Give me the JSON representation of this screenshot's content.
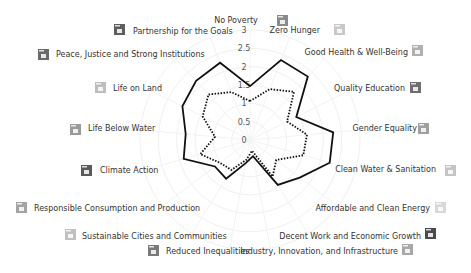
{
  "chart_data": {
    "type": "radar",
    "title": "",
    "center": [
      250,
      140
    ],
    "radius_px": 110,
    "rmax": 3,
    "ticks": [
      "0",
      "0.5",
      "1",
      "1.5",
      "2",
      "2.5",
      "3"
    ],
    "grid": true,
    "categories": [
      "No Poverty",
      "Zero Hunger",
      "Good Health & Well-Being",
      "Quality Education",
      "Gender Equality",
      "Clean Water & Sanitation",
      "Affordable and Clean Energy",
      "Decent Work and Economic Growth",
      "Industry, Innovation, and Infrastructure",
      "Reduced Inequalities",
      "Sustainable Cities and Communities",
      "Responsible Consumption and Production",
      "Climate Action",
      "Life Below Water",
      "Life on Land",
      "Peace, Justice and Strong Institutions",
      "Partnership for the Goals"
    ],
    "icon_colors": [
      "#8a8a8a",
      "#c8c8c8",
      "#b0b0b0",
      "#6e6e6e",
      "#a0a0a0",
      "#c4c4c4",
      "#d8d8d8",
      "#4a4a4a",
      "#a8a8a8",
      "#7a7a7a",
      "#c0c0c0",
      "#a4a4a4",
      "#5a5a5a",
      "#9a9a9a",
      "#bdbdbd",
      "#6a6a6a",
      "#5e5e5e"
    ],
    "series": [
      {
        "name": "Series 1",
        "style": "solid",
        "values": [
          1.47,
          2.34,
          2.34,
          1.41,
          2.28,
          2.26,
          1.7,
          1.44,
          0.45,
          0.64,
          1.24,
          1.2,
          1.88,
          1.76,
          2.06,
          2.18,
          2.26
        ]
      },
      {
        "name": "Series 2",
        "style": "dotted",
        "values": [
          1.06,
          1.49,
          1.78,
          1.13,
          1.56,
          1.51,
          0.9,
          1.17,
          0.3,
          0.55,
          0.96,
          1.03,
          1.41,
          0.96,
          1.44,
          1.68,
          1.4
        ]
      }
    ],
    "label_positions": [
      {
        "x": 236,
        "y": 23,
        "anchor": "middle",
        "icon": [
          277,
          15
        ]
      },
      {
        "x": 320,
        "y": 33,
        "anchor": "end",
        "icon": [
          334,
          24
        ]
      },
      {
        "x": 408,
        "y": 55,
        "anchor": "end",
        "icon": [
          412,
          45
        ]
      },
      {
        "x": 405,
        "y": 91,
        "anchor": "end",
        "icon": [
          410,
          82
        ]
      },
      {
        "x": 417,
        "y": 131,
        "anchor": "end",
        "icon": [
          418,
          123
        ]
      },
      {
        "x": 436,
        "y": 172,
        "anchor": "end",
        "icon": [
          445,
          165
        ]
      },
      {
        "x": 430,
        "y": 211,
        "anchor": "end",
        "icon": [
          435,
          202
        ]
      },
      {
        "x": 421,
        "y": 239,
        "anchor": "end",
        "icon": [
          425,
          228
        ]
      },
      {
        "x": 398,
        "y": 254,
        "anchor": "end",
        "icon": [
          402,
          244
        ]
      },
      {
        "x": 166,
        "y": 254,
        "anchor": "start",
        "icon": [
          148,
          245
        ]
      },
      {
        "x": 82,
        "y": 239,
        "anchor": "start",
        "icon": [
          65,
          229
        ]
      },
      {
        "x": 34,
        "y": 211,
        "anchor": "start",
        "icon": [
          16,
          202
        ]
      },
      {
        "x": 100,
        "y": 173,
        "anchor": "start",
        "icon": [
          81,
          165
        ]
      },
      {
        "x": 88,
        "y": 131,
        "anchor": "start",
        "icon": [
          70,
          124
        ]
      },
      {
        "x": 113,
        "y": 91,
        "anchor": "start",
        "icon": [
          95,
          82
        ]
      },
      {
        "x": 56,
        "y": 57,
        "anchor": "start",
        "icon": [
          38,
          49
        ]
      },
      {
        "x": 133,
        "y": 34,
        "anchor": "start",
        "icon": [
          114,
          24
        ]
      }
    ]
  }
}
